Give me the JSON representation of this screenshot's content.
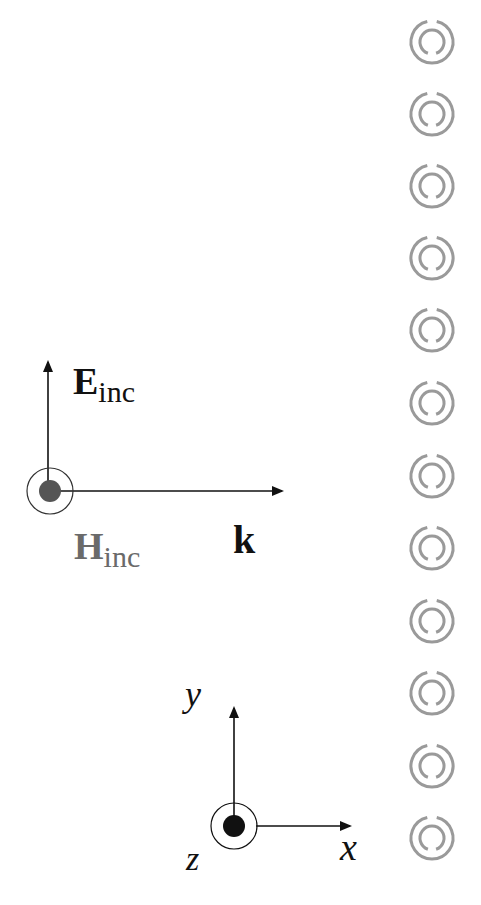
{
  "diagram": {
    "title": "",
    "labels": {
      "e_field_main": "E",
      "e_field_sub": "inc",
      "h_field_main": "H",
      "h_field_sub": "inc",
      "wave_vector": "k",
      "axis_x": "x",
      "axis_y": "y",
      "axis_z": "z"
    },
    "colors": {
      "e_field": "#111111",
      "h_field": "#6a6a6a",
      "ring": "#9a9a9a",
      "arrow": "#111111"
    },
    "srr_array": {
      "count": 12,
      "center_x": 432,
      "centers_y": [
        42,
        114,
        186,
        258,
        330,
        403,
        476,
        548,
        621,
        693,
        766,
        838
      ],
      "outer_radius": 21,
      "inner_radius": 12,
      "outer_gap": "top",
      "inner_gap": "bottom"
    }
  }
}
